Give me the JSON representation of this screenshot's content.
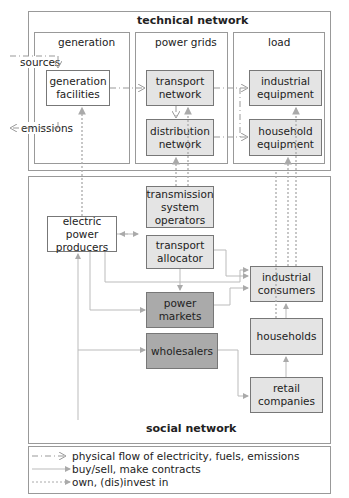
{
  "technical": {
    "title": "technical network",
    "columns": [
      "generation",
      "power grids",
      "load"
    ],
    "sources": "sources",
    "emissions": "emissions",
    "generation_facilities": "generation\nfacilities",
    "transport_network": "transport\nnetwork",
    "distribution_network": "distribution\nnetwork",
    "industrial_equipment": "industrial\nequipment",
    "household_equipment": "household\nequipment"
  },
  "social": {
    "title": "social network",
    "electric_power_producers": "electric power\nproducers",
    "tso": "transmission\nsystem\noperators",
    "transport_allocator": "transport\nallocator",
    "power_markets": "power\nmarkets",
    "wholesalers": "wholesalers",
    "industrial_consumers": "industrial\nconsumers",
    "households": "households",
    "retail_companies": "retail\ncompanies"
  },
  "legend": {
    "physical": "physical flow of electricity, fuels, emissions",
    "buysell": "buy/sell, make contracts",
    "own": "own, (dis)invest in"
  },
  "colors": {
    "light": "#e4e4e4",
    "dark": "#aaaaaa",
    "line": "#aaaaaa"
  }
}
